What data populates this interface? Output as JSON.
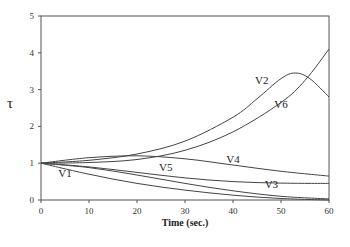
{
  "chart_data": {
    "type": "line",
    "title": "",
    "xlabel": "Time (sec.)",
    "ylabel": "τ",
    "xlim": [
      0,
      60
    ],
    "ylim": [
      0,
      5
    ],
    "xticks": [
      0,
      10,
      20,
      30,
      40,
      50,
      60
    ],
    "yticks": [
      0,
      1,
      2,
      3,
      4,
      5
    ],
    "grid": false,
    "legend": "inline labels",
    "series": [
      {
        "name": "V1",
        "x": [
          0,
          10,
          20,
          30,
          40,
          50,
          60
        ],
        "values": [
          1.0,
          0.7,
          0.45,
          0.27,
          0.13,
          0.04,
          0.0
        ],
        "label_pos": [
          5,
          0.62
        ]
      },
      {
        "name": "V2",
        "x": [
          0,
          10,
          20,
          30,
          40,
          45,
          50,
          53,
          56,
          60
        ],
        "values": [
          1.0,
          1.08,
          1.25,
          1.6,
          2.25,
          2.75,
          3.3,
          3.45,
          3.3,
          2.8
        ],
        "label_pos": [
          46,
          3.15
        ]
      },
      {
        "name": "V3",
        "x": [
          0,
          10,
          20,
          30,
          40,
          50,
          60
        ],
        "values": [
          1.0,
          0.88,
          0.68,
          0.45,
          0.25,
          0.1,
          0.03
        ],
        "label_pos": [
          48,
          0.32
        ]
      },
      {
        "name": "V4",
        "x": [
          0,
          10,
          20,
          30,
          40,
          50,
          60
        ],
        "values": [
          1.0,
          1.15,
          1.2,
          1.12,
          0.95,
          0.78,
          0.65
        ],
        "label_pos": [
          40,
          1.0
        ]
      },
      {
        "name": "V5",
        "x": [
          0,
          10,
          20,
          30,
          40,
          50,
          60
        ],
        "values": [
          1.0,
          0.9,
          0.75,
          0.6,
          0.5,
          0.46,
          0.45
        ],
        "label_pos": [
          26,
          0.8
        ]
      },
      {
        "name": "V6",
        "x": [
          0,
          10,
          20,
          30,
          40,
          50,
          55,
          60
        ],
        "values": [
          1.0,
          1.02,
          1.1,
          1.35,
          1.85,
          2.65,
          3.25,
          4.1
        ],
        "label_pos": [
          50,
          2.5
        ]
      }
    ]
  }
}
